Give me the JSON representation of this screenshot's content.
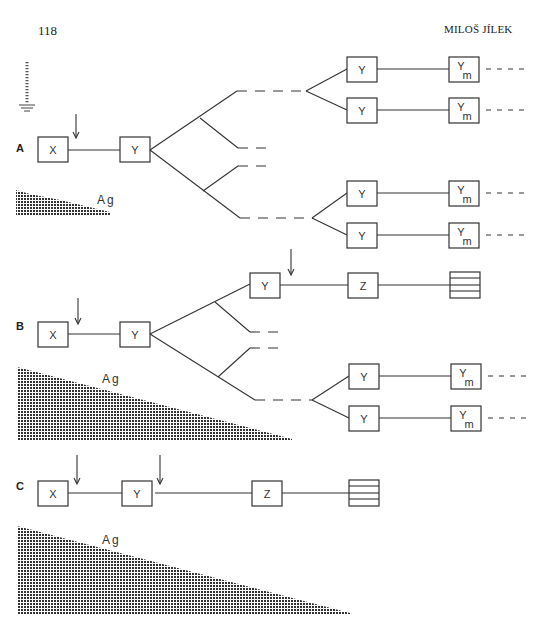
{
  "header": {
    "page_number": "118",
    "running_head": "MILOŠ JÍLEK"
  },
  "figure": {
    "ground_symbol": "ground-icon",
    "panels": [
      {
        "id": "A",
        "label": "A",
        "antigen_label": "Ag",
        "nodes": [
          {
            "label": "X",
            "x": 38,
            "y": 137
          },
          {
            "label": "Y",
            "x": 120,
            "y": 137
          },
          {
            "label": "Y",
            "x": 347,
            "y": 57
          },
          {
            "label": "Y",
            "x": 347,
            "y": 98
          },
          {
            "label": "Ym",
            "x": 449,
            "y": 57
          },
          {
            "label": "Ym",
            "x": 449,
            "y": 98
          },
          {
            "label": "Y",
            "x": 347,
            "y": 181
          },
          {
            "label": "Y",
            "x": 347,
            "y": 223
          },
          {
            "label": "Ym",
            "x": 449,
            "y": 181
          },
          {
            "label": "Ym",
            "x": 449,
            "y": 223
          }
        ],
        "arrows_at": [
          "X-Y link"
        ]
      },
      {
        "id": "B",
        "label": "B",
        "antigen_label": "Ag",
        "nodes": [
          {
            "label": "X",
            "x": 38,
            "y": 322
          },
          {
            "label": "Y",
            "x": 120,
            "y": 322
          },
          {
            "label": "Y",
            "x": 250,
            "y": 273
          },
          {
            "label": "Z",
            "x": 348,
            "y": 273
          },
          {
            "label": "plasma-cell",
            "x": 450,
            "y": 273
          },
          {
            "label": "Y",
            "x": 349,
            "y": 364
          },
          {
            "label": "Y",
            "x": 349,
            "y": 406
          },
          {
            "label": "Ym",
            "x": 451,
            "y": 364
          },
          {
            "label": "Ym",
            "x": 451,
            "y": 406
          }
        ],
        "arrows_at": [
          "X-Y link",
          "Y-Z link"
        ]
      },
      {
        "id": "C",
        "label": "C",
        "antigen_label": "Ag",
        "nodes": [
          {
            "label": "X",
            "x": 38,
            "y": 481
          },
          {
            "label": "Y",
            "x": 122,
            "y": 481
          },
          {
            "label": "Z",
            "x": 252,
            "y": 481
          },
          {
            "label": "plasma-cell",
            "x": 349,
            "y": 481
          }
        ],
        "arrows_at": [
          "X-Y link",
          "Y-Z link"
        ]
      }
    ],
    "node_text": {
      "X": "X",
      "Y": "Y",
      "Z": "Z",
      "Ym_main": "Y",
      "Ym_sub": "m"
    }
  }
}
